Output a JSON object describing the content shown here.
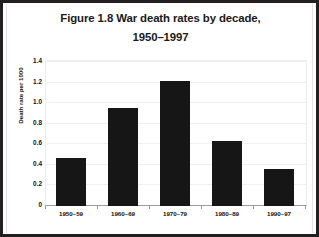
{
  "chart_data": {
    "type": "bar",
    "title": "Figure 1.8 War death rates by decade, 1950–1997",
    "title_lines": [
      "Figure 1.8 War death rates by decade,",
      "1950–1997"
    ],
    "xlabel": "",
    "ylabel": "Death rate per 1000",
    "categories": [
      "1950–59",
      "1960–69",
      "1970–79",
      "1980–89",
      "1990–97"
    ],
    "values": [
      0.47,
      0.95,
      1.22,
      0.63,
      0.36
    ],
    "ylim": [
      0,
      1.4
    ],
    "ytick_step": 0.2,
    "ytick_labels": [
      "1.4",
      "1.2",
      "1.0",
      "0.8",
      "0.6",
      "0.4",
      "0.2",
      "0"
    ],
    "ytick_values": [
      1.4,
      1.2,
      1.0,
      0.8,
      0.6,
      0.4,
      0.2,
      0
    ],
    "grid": true,
    "legend": false,
    "bar_color": "#161616",
    "plot_background": "#ffffff",
    "gridline_color": "#f0f0f0",
    "axis_color": "#9a9a9a",
    "frame_color": "#231f20"
  }
}
